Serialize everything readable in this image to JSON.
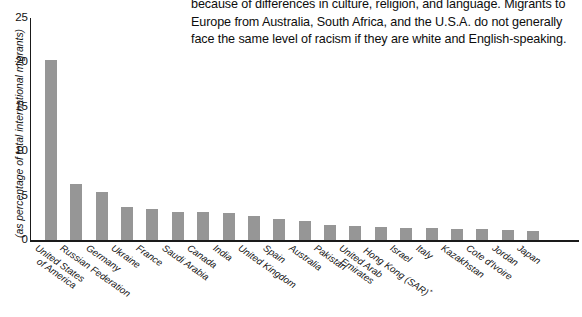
{
  "body_text": {
    "paragraph": "because of differences in culture, religion, and language. Migrants to Europe from Australia, South Africa, and the U.S.A. do not generally face the same level of racism if they are white and English-speaking."
  },
  "chart_data": {
    "type": "bar",
    "title": "",
    "xlabel": "",
    "ylabel": "(as percentage of total international migrants)",
    "ylim": [
      0,
      25
    ],
    "yticks": [
      0,
      5,
      10,
      15,
      20,
      25
    ],
    "grid": false,
    "legend": null,
    "bar_color": "#969696",
    "axis_color": "#1a1a1a",
    "categories": [
      "United States of America",
      "Russian Federation",
      "Germany",
      "Ukraine",
      "France",
      "Saudi Arabia",
      "Canada",
      "India",
      "United Kingdom",
      "Spain",
      "Australia",
      "Pakistan",
      "United Arab Emirates",
      "Hong Kong (SAR)*",
      "Israel",
      "Italy",
      "Kazakhstan",
      "Cote d'Ivoire",
      "Jordan",
      "Japan"
    ],
    "values": [
      20.3,
      6.3,
      5.4,
      3.7,
      3.5,
      3.2,
      3.2,
      3.0,
      2.7,
      2.4,
      2.1,
      1.7,
      1.6,
      1.5,
      1.3,
      1.3,
      1.2,
      1.2,
      1.1,
      1.0
    ],
    "category_lines": [
      [
        "United States",
        "of America"
      ],
      [
        "Russian Federation"
      ],
      [
        "Germany"
      ],
      [
        "Ukraine"
      ],
      [
        "France"
      ],
      [
        "Saudi Arabia"
      ],
      [
        "Canada"
      ],
      [
        "India"
      ],
      [
        "United Kingdom"
      ],
      [
        "Spain"
      ],
      [
        "Australia"
      ],
      [
        "Pakistan"
      ],
      [
        "United Arab",
        "Emirates"
      ],
      [
        "Hong Kong (SAR)*"
      ],
      [
        "Israel"
      ],
      [
        "Italy"
      ],
      [
        "Kazakhstan"
      ],
      [
        "Cote d'Ivoire"
      ],
      [
        "Jordan"
      ],
      [
        "Japan"
      ]
    ]
  }
}
